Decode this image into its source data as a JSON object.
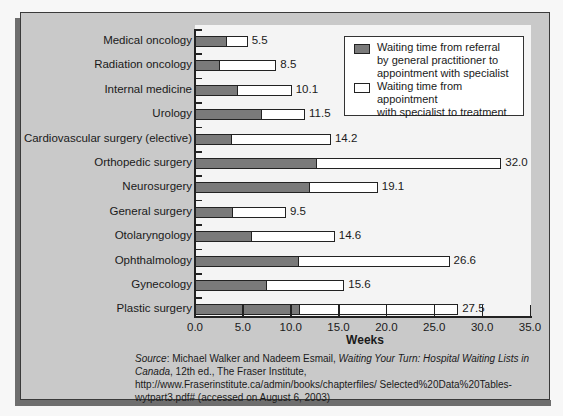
{
  "chart_data": {
    "type": "bar",
    "orientation": "horizontal",
    "stacked": true,
    "title": "",
    "xlabel": "Weeks",
    "ylabel": "",
    "xlim": [
      0,
      35
    ],
    "x_ticks": [
      "0.0",
      "5.0",
      "10.0",
      "15.0",
      "20.0",
      "25.0",
      "30.0",
      "35.0"
    ],
    "grid": false,
    "legend_position": "upper right",
    "categories": [
      "Medical oncology",
      "Radiation oncology",
      "Internal medicine",
      "Urology",
      "Cardiovascular surgery (elective)",
      "Orthopedic surgery",
      "Neurosurgery",
      "General surgery",
      "Otolaryngology",
      "Ophthalmology",
      "Gynecology",
      "Plastic surgery"
    ],
    "totals": [
      "5.5",
      "8.5",
      "10.1",
      "11.5",
      "14.2",
      "32.0",
      "19.1",
      "9.5",
      "14.6",
      "26.6",
      "15.6",
      "27.5"
    ],
    "series": [
      {
        "name": "Waiting time from referral by general practitioner to appointment with specialist",
        "color": "#7a7a7a",
        "values": [
          3.2,
          2.5,
          4.4,
          6.9,
          3.8,
          12.6,
          11.9,
          3.9,
          5.8,
          10.8,
          7.4,
          10.9
        ]
      },
      {
        "name": "Waiting time from appointment with specialist to treatment",
        "color": "#ffffff",
        "values": [
          2.3,
          6.0,
          5.7,
          4.6,
          10.4,
          19.4,
          7.2,
          5.6,
          8.8,
          15.8,
          8.2,
          16.6
        ]
      }
    ]
  },
  "legend": {
    "items": [
      {
        "label": "Waiting time from referral\nby general practitioner to\nappointment with specialist",
        "color": "#7a7a7a"
      },
      {
        "label": "Waiting time from appointment\nwith specialist to treatment",
        "color": "#ffffff"
      }
    ]
  },
  "source": {
    "label": "Source",
    "authors": ": Michael Walker and Nadeem Esmail, ",
    "title": "Waiting Your Turn: Hospital Waiting Lists in Canada",
    "rest": ", 12th ed., The Fraser Institute, http://www.Fraserinstitute.ca/admin/books/chapterfiles/ Selected%20Data%20Tables-wytpart3.pdf# (accessed on August 6, 2003)"
  }
}
